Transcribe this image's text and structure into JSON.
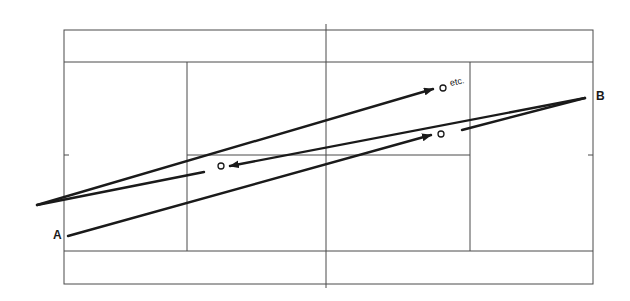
{
  "diagram": {
    "type": "tennis-court-shot-pattern",
    "labels": {
      "point_a": "A",
      "point_b": "B",
      "continuation": "etc."
    },
    "colors": {
      "court_lines": "#4a4a4a",
      "shot_paths": "#1a1a1a",
      "background": "#ffffff"
    },
    "court": {
      "outer": {
        "x1": 64,
        "y1": 30,
        "x2": 593,
        "y2": 284
      },
      "doubles_top_y": 62,
      "doubles_bottom_y": 251,
      "net_x": 326,
      "service_left_x": 187,
      "service_right_x": 470,
      "center_service_y": 155
    },
    "shots": [
      {
        "name": "shot-1",
        "from": "A",
        "to": "ball-1",
        "direction": "right"
      },
      {
        "name": "shot-2",
        "from": "B",
        "to": "ball-2",
        "direction": "left"
      },
      {
        "name": "shot-3",
        "from": "left-apex",
        "to": "ball-3",
        "direction": "right"
      }
    ],
    "balls": [
      {
        "name": "ball-1",
        "x": 441,
        "y": 134
      },
      {
        "name": "ball-2",
        "x": 221,
        "y": 166
      },
      {
        "name": "ball-3",
        "x": 443,
        "y": 88
      }
    ]
  }
}
